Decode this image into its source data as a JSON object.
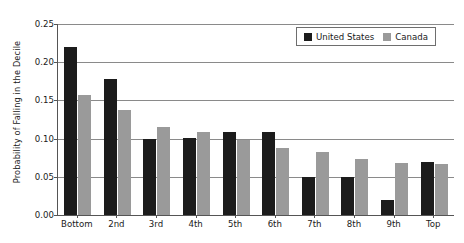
{
  "chart_data": {
    "type": "bar",
    "title": "",
    "xlabel": "",
    "ylabel": "Probability of Falling in the Decile",
    "categories": [
      "Bottom",
      "2nd",
      "3rd",
      "4th",
      "5th",
      "6th",
      "7th",
      "8th",
      "9th",
      "Top"
    ],
    "series": [
      {
        "name": "United States",
        "color": "#1c1c1c",
        "values": [
          0.22,
          0.178,
          0.1,
          0.101,
          0.109,
          0.109,
          0.05,
          0.05,
          0.02,
          0.069
        ]
      },
      {
        "name": "Canada",
        "color": "#9a9a9a",
        "values": [
          0.157,
          0.137,
          0.115,
          0.109,
          0.098,
          0.088,
          0.082,
          0.073,
          0.068,
          0.067
        ]
      }
    ],
    "ylim": [
      0,
      0.25
    ],
    "ytick_values": [
      0.0,
      0.05,
      0.1,
      0.15,
      0.2,
      0.25
    ],
    "ytick_labels": [
      "0.00",
      "0.05",
      "0.10",
      "0.15",
      "0.20",
      "0.25"
    ],
    "grid": true,
    "grid_axis": "y",
    "legend_position": "top-right"
  },
  "legend": {
    "entries": [
      {
        "label": "United States",
        "swatch": "black-square-swatch"
      },
      {
        "label": "Canada",
        "swatch": "gray-square-swatch"
      }
    ]
  }
}
